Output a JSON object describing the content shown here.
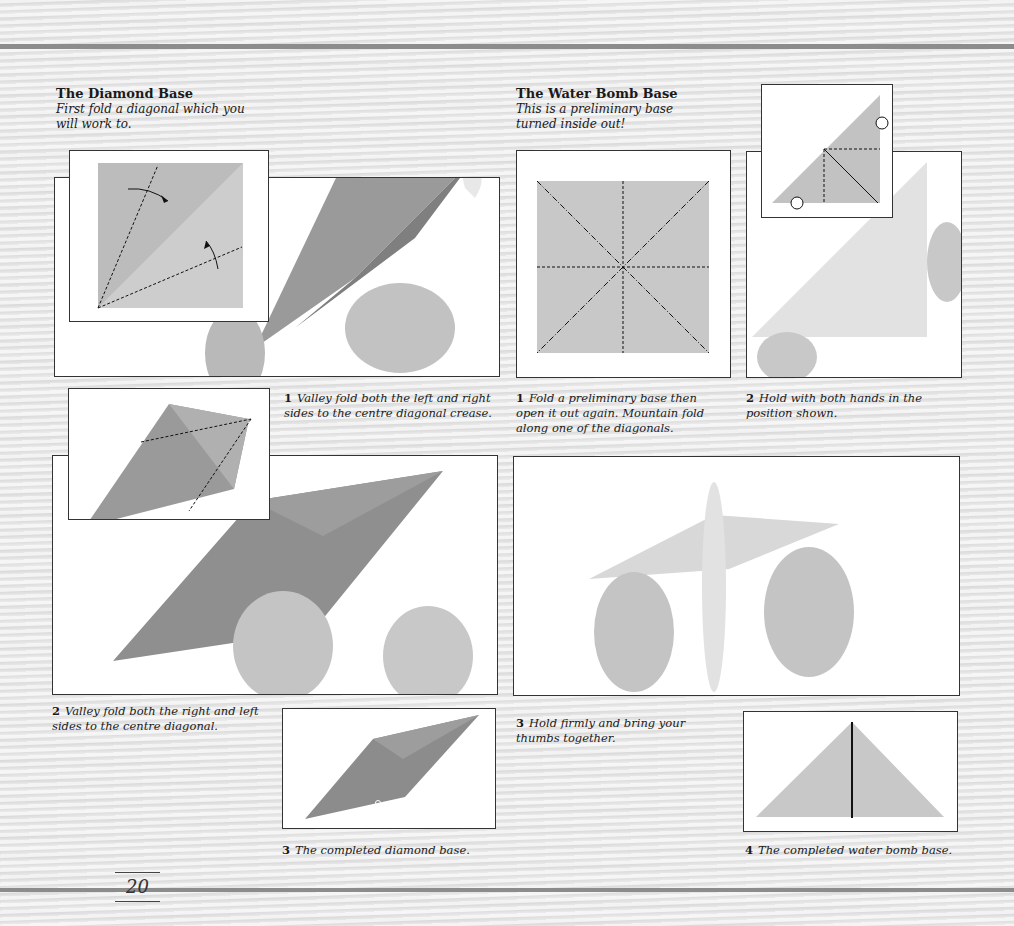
{
  "page_number": "20",
  "diamond_base": {
    "title": "The Diamond Base",
    "intro": "First fold a diagonal which you will work to.",
    "steps": [
      {
        "num": "1",
        "text": "Valley fold both the left and right sides to the centre diagonal crease."
      },
      {
        "num": "2",
        "text": "Valley fold both the right and left sides to the centre diagonal."
      },
      {
        "num": "3",
        "text": "The completed diamond base."
      }
    ]
  },
  "water_bomb_base": {
    "title": "The Water Bomb Base",
    "intro": "This is a preliminary base turned inside out!",
    "steps": [
      {
        "num": "1",
        "text": "Fold a preliminary base then open it out again. Mountain fold along one of the diagonals."
      },
      {
        "num": "2",
        "text": "Hold with both hands in the position shown."
      },
      {
        "num": "3",
        "text": "Hold firmly and bring your thumbs together."
      },
      {
        "num": "4",
        "text": "The completed water bomb base."
      }
    ]
  },
  "colors": {
    "paper_dark": "#8f8f8f",
    "paper_light": "#d4d4d4",
    "frame_border": "#333333",
    "rule": "#8c8c8c"
  }
}
